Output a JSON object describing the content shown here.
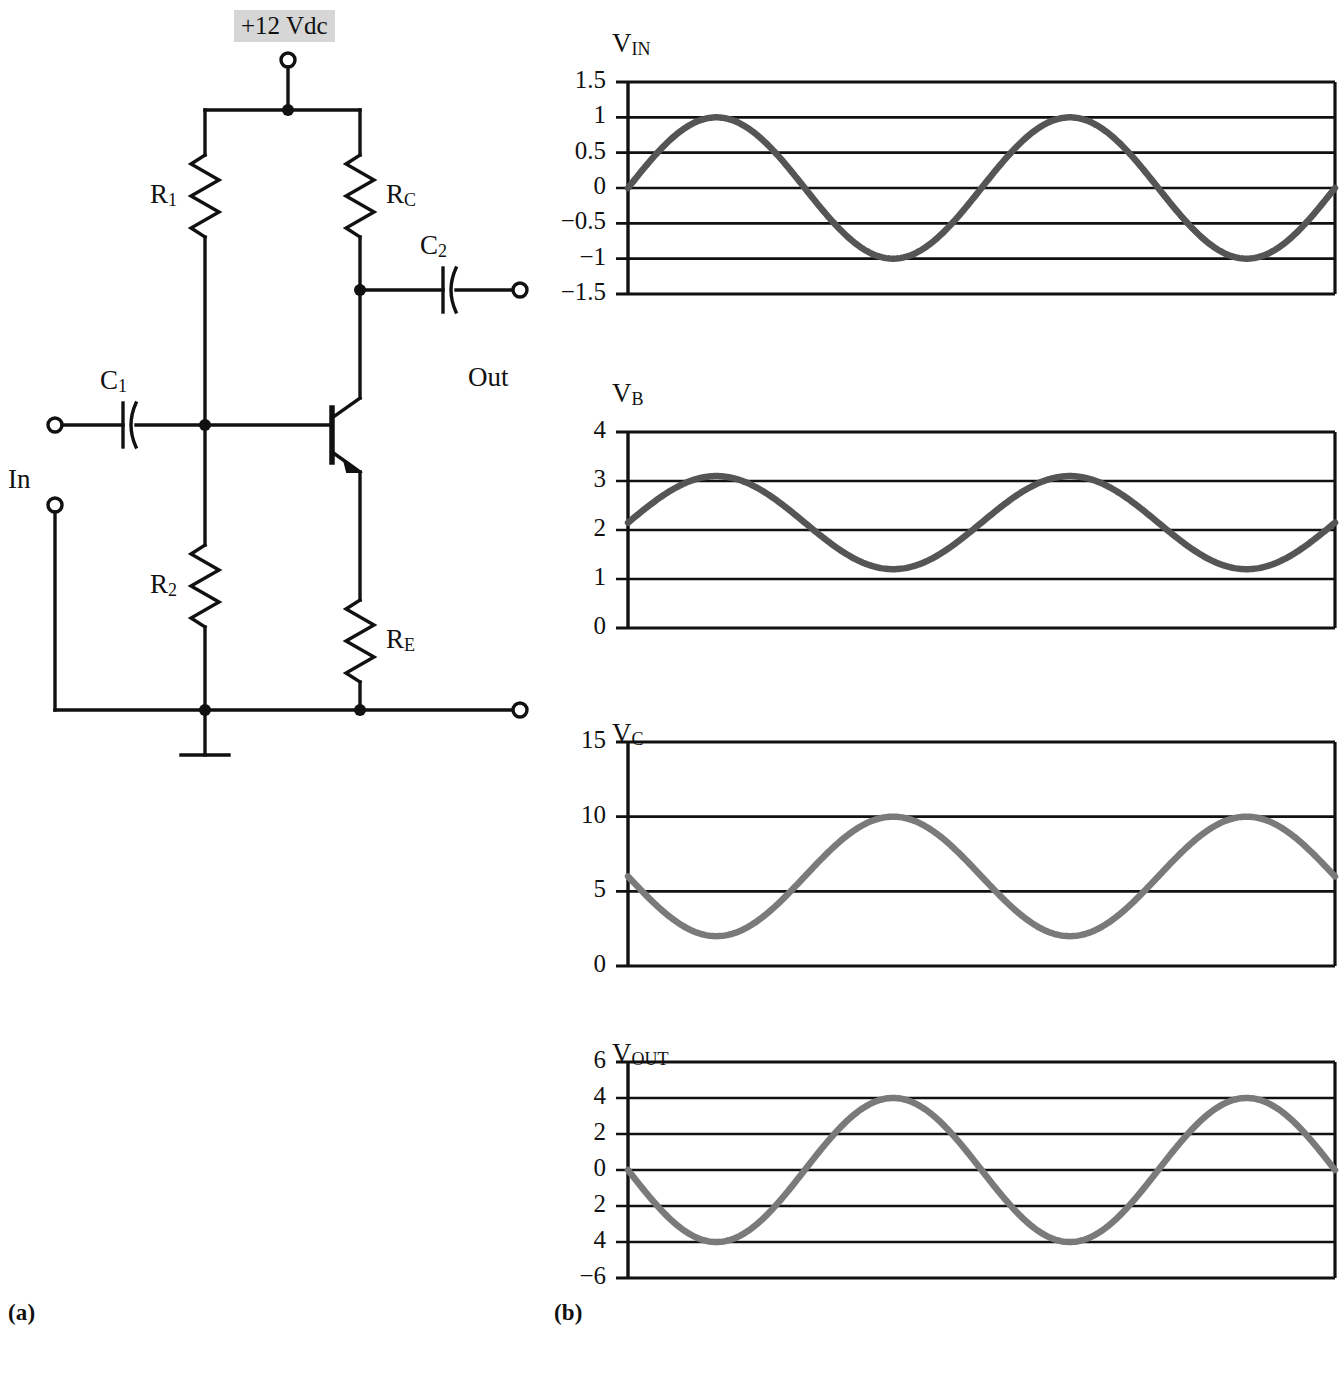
{
  "figure": {
    "panel_a_label": "(a)",
    "panel_b_label": "(b)"
  },
  "circuit": {
    "supply_label": "+12 Vdc",
    "input_label": "In",
    "output_label": "Out",
    "components": [
      {
        "id": "R1",
        "label_main": "R",
        "label_sub": "1"
      },
      {
        "id": "R2",
        "label_main": "R",
        "label_sub": "2"
      },
      {
        "id": "RC",
        "label_main": "R",
        "label_sub": "C"
      },
      {
        "id": "RE",
        "label_main": "R",
        "label_sub": "E"
      },
      {
        "id": "C1",
        "label_main": "C",
        "label_sub": "1"
      },
      {
        "id": "C2",
        "label_main": "C",
        "label_sub": "2"
      }
    ],
    "transistor_type": "NPN",
    "ground_symbol": "earth-ground",
    "wire_color": "#111111",
    "supply_highlight_color": "#d6d6d6"
  },
  "chart_data": [
    {
      "type": "line",
      "name": "VIN",
      "title_main": "V",
      "title_sub": "IN",
      "ylabel": "",
      "xlabel": "",
      "ytick_labels": [
        "1.5",
        "1",
        "0.5",
        "0",
        "−0.5",
        "−1",
        "−1.5"
      ],
      "ytick_values": [
        1.5,
        1,
        0.5,
        0,
        -0.5,
        -1,
        -1.5
      ],
      "ylim": [
        -1.5,
        1.5
      ],
      "grid": true,
      "legend": "none",
      "cycles": 2,
      "offset": 0,
      "amplitude": 1,
      "phase_deg": 0,
      "inverted": false,
      "trace_color": "#555555",
      "x": [
        0,
        0.125,
        0.25,
        0.375,
        0.5,
        0.625,
        0.75,
        0.875,
        1.0,
        1.125,
        1.25,
        1.375,
        1.5,
        1.625,
        1.75,
        1.875,
        2.0
      ],
      "values": [
        0,
        0.707,
        1,
        0.707,
        0,
        -0.707,
        -1,
        -0.707,
        0,
        0.707,
        1,
        0.707,
        0,
        -0.707,
        -1,
        -0.707,
        0
      ]
    },
    {
      "type": "line",
      "name": "VB",
      "title_main": "V",
      "title_sub": "B",
      "ylabel": "",
      "xlabel": "",
      "ytick_labels": [
        "4",
        "3",
        "2",
        "1",
        "0"
      ],
      "ytick_values": [
        4,
        3,
        2,
        1,
        0
      ],
      "ylim": [
        0,
        4
      ],
      "grid": true,
      "legend": "none",
      "cycles": 2,
      "offset": 2.15,
      "amplitude": 0.95,
      "phase_deg": 0,
      "inverted": false,
      "trace_color": "#555555",
      "x": [
        0,
        0.125,
        0.25,
        0.375,
        0.5,
        0.625,
        0.75,
        0.875,
        1.0,
        1.125,
        1.25,
        1.375,
        1.5,
        1.625,
        1.75,
        1.875,
        2.0
      ],
      "values": [
        2.15,
        2.82,
        3.1,
        2.82,
        2.15,
        1.48,
        1.2,
        1.48,
        2.15,
        2.82,
        3.1,
        2.82,
        2.15,
        1.48,
        1.2,
        1.48,
        2.15
      ]
    },
    {
      "type": "line",
      "name": "VC",
      "title_main": "V",
      "title_sub": "C",
      "ylabel": "",
      "xlabel": "",
      "ytick_labels": [
        "15",
        "10",
        "5",
        "0"
      ],
      "ytick_values": [
        15,
        10,
        5,
        0
      ],
      "ylim": [
        0,
        15
      ],
      "grid": true,
      "legend": "none",
      "cycles": 2,
      "offset": 6,
      "amplitude": 4,
      "phase_deg": 180,
      "inverted": true,
      "trace_color": "#7a7a7a",
      "x": [
        0,
        0.125,
        0.25,
        0.375,
        0.5,
        0.625,
        0.75,
        0.875,
        1.0,
        1.125,
        1.25,
        1.375,
        1.5,
        1.625,
        1.75,
        1.875,
        2.0
      ],
      "values": [
        6,
        3.17,
        2,
        3.17,
        6,
        8.83,
        10,
        8.83,
        6,
        3.17,
        2,
        3.17,
        6,
        8.83,
        10,
        8.83,
        6
      ]
    },
    {
      "type": "line",
      "name": "VOUT",
      "title_main": "V",
      "title_sub": "OUT",
      "ylabel": "",
      "xlabel": "",
      "ytick_labels": [
        "6",
        "4",
        "2",
        "0",
        "2",
        "4",
        "−6"
      ],
      "ytick_values": [
        6,
        4,
        2,
        0,
        -2,
        -4,
        -6
      ],
      "ylim": [
        -6,
        6
      ],
      "grid": true,
      "legend": "none",
      "cycles": 2,
      "offset": 0,
      "amplitude": 4,
      "phase_deg": 180,
      "inverted": true,
      "trace_color": "#7a7a7a",
      "x": [
        0,
        0.125,
        0.25,
        0.375,
        0.5,
        0.625,
        0.75,
        0.875,
        1.0,
        1.125,
        1.25,
        1.375,
        1.5,
        1.625,
        1.75,
        1.875,
        2.0
      ],
      "values": [
        0,
        -2.83,
        -4,
        -2.83,
        0,
        2.83,
        4,
        2.83,
        0,
        -2.83,
        -4,
        -2.83,
        0,
        2.83,
        4,
        2.83,
        0
      ]
    }
  ]
}
